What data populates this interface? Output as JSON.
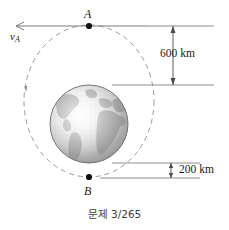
{
  "figure": {
    "caption": "문제 3/265",
    "background_color": "#ffffff",
    "line_color": "#6e6e6e",
    "orbit_color": "#9a9a9a",
    "text_color": "#1c1c1c"
  },
  "points": {
    "apogee": {
      "label": "A",
      "name": "point-a",
      "x": 89,
      "y": 26
    },
    "perigee": {
      "label": "B",
      "name": "point-b",
      "x": 89,
      "y": 177
    }
  },
  "velocity": {
    "label": "v",
    "subscript": "A",
    "direction": "left"
  },
  "dimensions": [
    {
      "id": "apogee-altitude",
      "label": "600 km",
      "value": 600,
      "unit": "km"
    },
    {
      "id": "perigee-altitude",
      "label": "200 km",
      "value": 200,
      "unit": "km"
    }
  ],
  "earth": {
    "name": "earth-globe",
    "cx": 89,
    "cy": 124,
    "r": 39,
    "ocean_light": "#f2f2f2",
    "ocean_mid": "#c8c8c8",
    "ocean_dark": "#8e8e8e",
    "land": "#9b9b9b",
    "outline": "#6a6a6a"
  },
  "orbit": {
    "name": "elliptical-orbit",
    "cx": 89,
    "cy": 101,
    "rx": 65,
    "ry": 76,
    "style": "dashed",
    "direction_marker": "counterclockwise"
  }
}
